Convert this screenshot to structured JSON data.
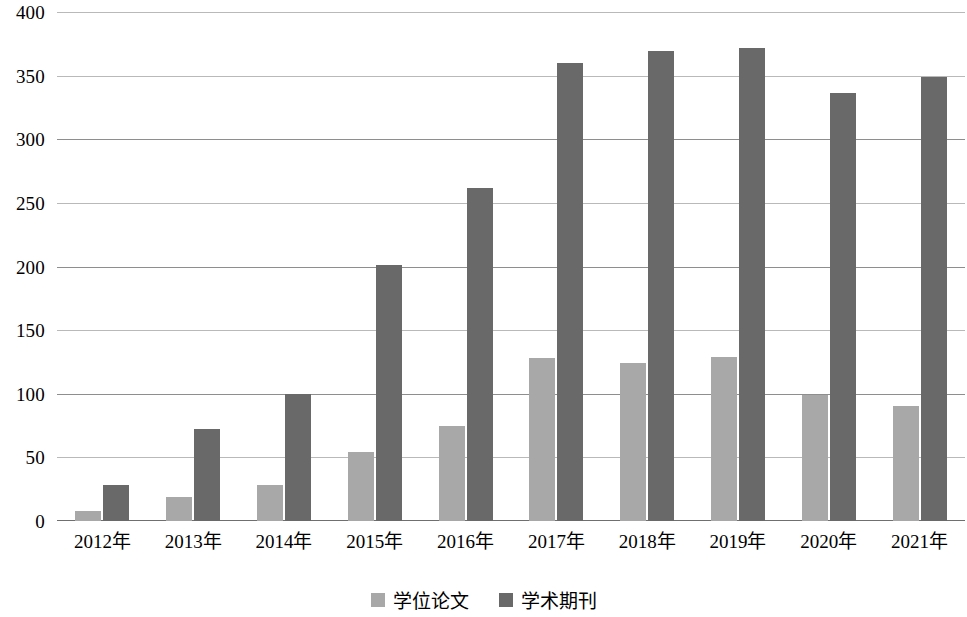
{
  "chart_data": {
    "type": "bar",
    "title": "",
    "subtitle": "",
    "xlabel": "",
    "ylabel": "",
    "ylim": [
      0,
      400
    ],
    "ytick_step": 50,
    "yticks": [
      "400",
      "350",
      "300",
      "250",
      "200",
      "150",
      "100",
      "50",
      "0"
    ],
    "grid": true,
    "legend_position": "bottom",
    "categories": [
      "2012年",
      "2013年",
      "2014年",
      "2015年",
      "2016年",
      "2017年",
      "2018年",
      "2019年",
      "2020年",
      "2021年"
    ],
    "series": [
      {
        "name": "学位论文",
        "color": "#a8a8a8",
        "values": [
          8,
          19,
          28,
          54,
          75,
          128,
          124,
          129,
          99,
          90
        ]
      },
      {
        "name": "学术期刊",
        "color": "#696969",
        "values": [
          28,
          72,
          100,
          201,
          262,
          360,
          369,
          372,
          336,
          349
        ]
      }
    ]
  }
}
